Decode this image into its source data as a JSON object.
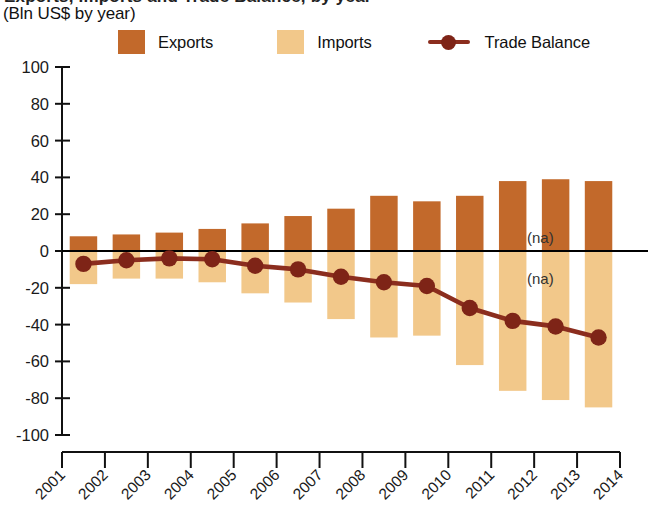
{
  "header": {
    "title_clipped": "Exports, Imports and Trade Balance, by year",
    "subtitle": "(Bln US$ by year)"
  },
  "legend": {
    "items": [
      {
        "label": "Exports",
        "marker": "square-swatch",
        "color": "#C2692B"
      },
      {
        "label": "Imports",
        "marker": "square-swatch",
        "color": "#F2C88A"
      },
      {
        "label": "Trade Balance",
        "marker": "line-with-dot",
        "color": "#8B2D1E"
      }
    ]
  },
  "annotations": {
    "na_above": "(na)",
    "na_below": "(na)"
  },
  "chart_data": {
    "type": "bar",
    "title": "Exports, Imports and Trade Balance, by year",
    "subtitle": "(Bln US$ by year)",
    "xlabel": "",
    "ylabel": "Bln US$",
    "ylim": [
      -100,
      100
    ],
    "yticks": [
      100,
      80,
      60,
      40,
      20,
      0,
      -20,
      -40,
      -60,
      -80,
      -100
    ],
    "ytick_labels": [
      "100",
      "80",
      "60",
      "40",
      "20",
      "0",
      "-20",
      "-40",
      "-60",
      "-80",
      "-100"
    ],
    "xticks": [
      "2001",
      "2002",
      "2003",
      "2004",
      "2005",
      "2006",
      "2007",
      "2008",
      "2009",
      "2010",
      "2011",
      "2012",
      "2013",
      "2014"
    ],
    "categories": [
      "2001",
      "2002",
      "2003",
      "2004",
      "2005",
      "2006",
      "2007",
      "2008",
      "2009",
      "2010",
      "2011",
      "2012",
      "2013"
    ],
    "grid": false,
    "legend_position": "top",
    "series": [
      {
        "name": "Exports",
        "type": "bar",
        "color": "#C2692B",
        "values": [
          8,
          9,
          10,
          12,
          15,
          19,
          23,
          30,
          27,
          30,
          38,
          39,
          38
        ]
      },
      {
        "name": "Imports",
        "type": "bar",
        "color": "#F2C88A",
        "values": [
          -18,
          -15,
          -15,
          -17,
          -23,
          -28,
          -37,
          -47,
          -46,
          -62,
          -76,
          -81,
          -85
        ]
      },
      {
        "name": "Trade Balance",
        "type": "line",
        "color": "#8B2D1E",
        "values": [
          -7,
          -5,
          -4,
          -4.5,
          -8,
          -10,
          -14,
          -17,
          -19,
          -31,
          -38,
          -41,
          -47
        ]
      }
    ],
    "notes": [
      "2014 has no data: marked (na) above and below the zero axis"
    ]
  }
}
